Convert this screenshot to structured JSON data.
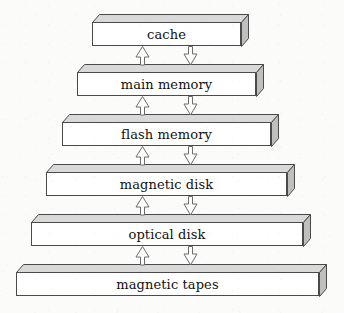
{
  "figure": {
    "kind": "diagram",
    "orientation": "vertical-stack-pyramid",
    "background_color": "#fbfbfa",
    "geometry": {
      "width": 344,
      "height": 313,
      "skew_x": 7,
      "skew_y": 8,
      "front_height": 24,
      "row_pitch": 50
    },
    "colors": {
      "front_face": "#ffffff",
      "top_face": "#d9d9d9",
      "side_face": "#bfbfbf",
      "outline": "#4a4a4a",
      "text": "#111111",
      "arrow_outline": "#6d6d6d",
      "arrow_fill": "#ffffff"
    },
    "levels": [
      {
        "id": "cache",
        "label": "cache",
        "front_left": 92,
        "front_width": 149,
        "front_top": 22,
        "rank": 1
      },
      {
        "id": "main-memory",
        "label": "main memory",
        "front_left": 77,
        "front_width": 179,
        "front_top": 72,
        "rank": 2
      },
      {
        "id": "flash-memory",
        "label": "flash memory",
        "front_left": 62,
        "front_width": 209,
        "front_top": 122,
        "rank": 3
      },
      {
        "id": "magnetic-disk",
        "label": "magnetic disk",
        "front_left": 46,
        "front_width": 241,
        "front_top": 172,
        "rank": 4
      },
      {
        "id": "optical-disk",
        "label": "optical disk",
        "front_left": 31,
        "front_width": 272,
        "front_top": 222,
        "rank": 5
      },
      {
        "id": "magnetic-tapes",
        "label": "magnetic tapes",
        "front_left": 16,
        "front_width": 303,
        "front_top": 272,
        "rank": 6
      }
    ],
    "connectors": [
      {
        "id": "cache-up",
        "direction": "up",
        "center_x": 142,
        "gap_index": 0,
        "from": "main-memory",
        "to": "cache"
      },
      {
        "id": "cache-down",
        "direction": "down",
        "center_x": 190,
        "gap_index": 0,
        "from": "cache",
        "to": "main-memory"
      },
      {
        "id": "main-memory-up",
        "direction": "up",
        "center_x": 142,
        "gap_index": 1,
        "from": "flash-memory",
        "to": "main-memory"
      },
      {
        "id": "main-memory-down",
        "direction": "down",
        "center_x": 190,
        "gap_index": 1,
        "from": "main-memory",
        "to": "flash-memory"
      },
      {
        "id": "flash-memory-up",
        "direction": "up",
        "center_x": 142,
        "gap_index": 2,
        "from": "magnetic-disk",
        "to": "flash-memory"
      },
      {
        "id": "flash-memory-down",
        "direction": "down",
        "center_x": 190,
        "gap_index": 2,
        "from": "flash-memory",
        "to": "magnetic-disk"
      },
      {
        "id": "magnetic-disk-up",
        "direction": "up",
        "center_x": 142,
        "gap_index": 3,
        "from": "optical-disk",
        "to": "magnetic-disk"
      },
      {
        "id": "magnetic-disk-down",
        "direction": "down",
        "center_x": 190,
        "gap_index": 3,
        "from": "magnetic-disk",
        "to": "optical-disk"
      },
      {
        "id": "optical-disk-up",
        "direction": "up",
        "center_x": 142,
        "gap_index": 4,
        "from": "magnetic-tapes",
        "to": "optical-disk"
      },
      {
        "id": "optical-disk-down",
        "direction": "down",
        "center_x": 190,
        "gap_index": 4,
        "from": "optical-disk",
        "to": "magnetic-tapes"
      }
    ]
  }
}
